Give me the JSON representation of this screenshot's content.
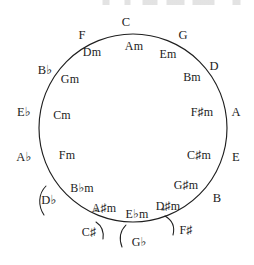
{
  "figure": {
    "kind": "circle-of-fifths-diagram",
    "circle": {
      "cx": 133,
      "cy": 128,
      "r": 94
    },
    "stroke_color": "#1f1f1f",
    "background_color": "#ffffff"
  },
  "major_keys": [
    {
      "label": "C",
      "x": 126,
      "y": 22,
      "angle_deg": 0
    },
    {
      "label": "G",
      "x": 183,
      "y": 35,
      "angle_deg": 30
    },
    {
      "label": "D",
      "x": 214,
      "y": 66,
      "angle_deg": 60
    },
    {
      "label": "A",
      "x": 236,
      "y": 112,
      "angle_deg": 90
    },
    {
      "label": "E",
      "x": 236,
      "y": 157,
      "angle_deg": 120
    },
    {
      "label": "B",
      "x": 217,
      "y": 198,
      "angle_deg": 150
    },
    {
      "label": "F",
      "x": 82,
      "y": 35,
      "angle_deg": -30
    },
    {
      "label": "B♭",
      "x": 45,
      "y": 70,
      "angle_deg": -60
    },
    {
      "label": "E♭",
      "x": 24,
      "y": 112,
      "angle_deg": -90
    },
    {
      "label": "A♭",
      "x": 24,
      "y": 157,
      "angle_deg": -120
    },
    {
      "label": "D♭",
      "x": 49,
      "y": 200,
      "angle_deg": -150
    }
  ],
  "minor_keys": [
    {
      "label": "Am",
      "x": 134,
      "y": 46
    },
    {
      "label": "Em",
      "x": 168,
      "y": 54
    },
    {
      "label": "Bm",
      "x": 192,
      "y": 77
    },
    {
      "label": "F♯m",
      "x": 202,
      "y": 112
    },
    {
      "label": "C♯m",
      "x": 199,
      "y": 155
    },
    {
      "label": "G♯m",
      "x": 186,
      "y": 185
    },
    {
      "label": "D♯m",
      "x": 168,
      "y": 206
    },
    {
      "label": "E♭m",
      "x": 137,
      "y": 214
    },
    {
      "label": "A♯m",
      "x": 104,
      "y": 208
    },
    {
      "label": "B♭m",
      "x": 82,
      "y": 188
    },
    {
      "label": "Fm",
      "x": 67,
      "y": 155
    },
    {
      "label": "Cm",
      "x": 62,
      "y": 115
    },
    {
      "label": "Gm",
      "x": 70,
      "y": 79
    },
    {
      "label": "Dm",
      "x": 92,
      "y": 52
    }
  ],
  "enharmonic_keys": [
    {
      "label": "C♯",
      "x": 89,
      "y": 232
    },
    {
      "label": "G♭",
      "x": 139,
      "y": 242
    },
    {
      "label": "F♯",
      "x": 186,
      "y": 230
    }
  ],
  "asterisks": [
    {
      "x": 96,
      "y": 212
    },
    {
      "x": 163,
      "y": 211
    }
  ],
  "brackets": [
    {
      "name": "d-flat-bracket",
      "path": "M 46,186 C 38,194 38,206 44,215"
    },
    {
      "name": "c-sharp-bracket",
      "path": "M 96,222 C 102,226 104,232 103,239"
    },
    {
      "name": "g-flat-bracket",
      "path": "M 126,225 C 120,231 119,239 122,247"
    },
    {
      "name": "f-sharp-bracket",
      "path": "M 165,216 C 172,220 175,227 173,235"
    }
  ]
}
